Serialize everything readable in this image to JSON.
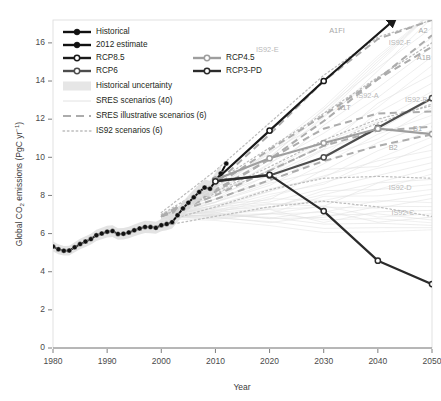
{
  "chart_data": {
    "type": "line",
    "title": "",
    "xlabel": "Year",
    "ylabel": "Global CO2 emissions (PgC yr-1)",
    "ylabel_rich": "Global CO₂ emissions (PgC yr⁻¹)",
    "xlim": [
      1980,
      2050
    ],
    "ylim": [
      0,
      17.2
    ],
    "xticks": [
      1980,
      1990,
      2000,
      2010,
      2020,
      2030,
      2040,
      2050
    ],
    "yticks": [
      0,
      2,
      4,
      6,
      8,
      10,
      12,
      14,
      16
    ],
    "grid": false,
    "legend_position": "top-left",
    "series": [
      {
        "name": "Historical",
        "style": "solid-black-filled-markers",
        "color": "#111111",
        "x": [
          1980,
          1981,
          1982,
          1983,
          1984,
          1985,
          1986,
          1987,
          1988,
          1989,
          1990,
          1991,
          1992,
          1993,
          1994,
          1995,
          1996,
          1997,
          1998,
          1999,
          2000,
          2001,
          2002,
          2003,
          2004,
          2005,
          2006,
          2007,
          2008,
          2009,
          2010,
          2011
        ],
        "values": [
          5.32,
          5.18,
          5.1,
          5.11,
          5.28,
          5.45,
          5.58,
          5.71,
          5.91,
          6.0,
          6.1,
          6.13,
          5.98,
          5.99,
          6.06,
          6.17,
          6.27,
          6.35,
          6.34,
          6.3,
          6.44,
          6.5,
          6.6,
          6.96,
          7.32,
          7.62,
          7.9,
          8.18,
          8.41,
          8.35,
          8.75,
          9.15
        ],
        "uncertainty_band_pct": 5
      },
      {
        "name": "2012 estimate",
        "style": "solid-black-filled-markers",
        "color": "#111111",
        "x": [
          2011,
          2012
        ],
        "values": [
          9.15,
          9.67
        ]
      },
      {
        "name": "RCP8.5",
        "style": "solid-dark-open-markers",
        "color": "#1a1a1a",
        "x": [
          2010,
          2020,
          2030,
          2043
        ],
        "values": [
          8.8,
          11.4,
          14.0,
          17.2
        ],
        "marker_years": [
          2010,
          2020,
          2030
        ],
        "arrow_end": true
      },
      {
        "name": "RCP6",
        "style": "solid-mid-open-markers",
        "color": "#4d4d4d",
        "x": [
          2010,
          2020,
          2030,
          2040,
          2050
        ],
        "values": [
          8.78,
          9.05,
          10.0,
          11.55,
          13.1
        ]
      },
      {
        "name": "RCP4.5",
        "style": "solid-light-open-markers",
        "color": "#9e9e9e",
        "x": [
          2010,
          2020,
          2030,
          2040,
          2050
        ],
        "values": [
          8.82,
          9.95,
          10.75,
          11.5,
          11.22
        ]
      },
      {
        "name": "RCP3-PD",
        "style": "solid-dark-open-markers",
        "color": "#2b2b2b",
        "x": [
          2010,
          2020,
          2030,
          2040,
          2050
        ],
        "values": [
          8.74,
          9.08,
          7.18,
          4.58,
          3.35
        ]
      }
    ],
    "sres_illustrative": [
      {
        "name": "A1FI",
        "x": [
          2000,
          2010,
          2020,
          2030,
          2040,
          2050
        ],
        "values": [
          6.9,
          8.6,
          11.2,
          14.0,
          16.2,
          17.2
        ],
        "label_xy": [
          2031,
          16.6
        ]
      },
      {
        "name": "A2",
        "x": [
          2000,
          2010,
          2020,
          2030,
          2040,
          2050
        ],
        "values": [
          6.9,
          8.3,
          9.9,
          11.9,
          14.1,
          16.4
        ],
        "label_xy": [
          2047.5,
          16.6
        ]
      },
      {
        "name": "A1B",
        "x": [
          2000,
          2010,
          2020,
          2030,
          2040,
          2050
        ],
        "values": [
          6.9,
          8.5,
          10.4,
          12.2,
          14.1,
          15.8
        ],
        "label_xy": [
          2047.2,
          15.2
        ]
      },
      {
        "name": "A1T",
        "x": [
          2000,
          2010,
          2020,
          2030,
          2040,
          2050
        ],
        "values": [
          6.9,
          8.2,
          9.9,
          11.5,
          12.3,
          12.4
        ],
        "label_xy": [
          2032.5,
          12.6
        ]
      },
      {
        "name": "B1",
        "x": [
          2000,
          2010,
          2020,
          2030,
          2040,
          2050
        ],
        "values": [
          6.9,
          8.0,
          9.3,
          10.6,
          11.4,
          11.6
        ],
        "label_xy": [
          2046.5,
          11.5
        ]
      },
      {
        "name": "B2",
        "x": [
          2000,
          2010,
          2020,
          2030,
          2040,
          2050
        ],
        "values": [
          6.9,
          7.8,
          8.8,
          9.8,
          10.6,
          11.2
        ],
        "label_xy": [
          2042.0,
          10.5
        ]
      }
    ],
    "is92_scenarios": [
      {
        "name": "IS92-E",
        "x": [
          2000,
          2010,
          2020,
          2030,
          2040,
          2050
        ],
        "values": [
          7.1,
          9.3,
          11.8,
          14.3,
          16.3,
          17.2
        ],
        "label_xy": [
          2017.5,
          15.6
        ]
      },
      {
        "name": "IS92-F",
        "x": [
          2000,
          2010,
          2020,
          2030,
          2040,
          2050
        ],
        "values": [
          7.0,
          8.7,
          10.5,
          12.3,
          14.2,
          16.0
        ],
        "label_xy": [
          2042.0,
          16.0
        ]
      },
      {
        "name": "IS92-A",
        "x": [
          2000,
          2010,
          2020,
          2030,
          2040,
          2050
        ],
        "values": [
          6.9,
          8.2,
          9.5,
          10.9,
          12.0,
          12.7
        ],
        "label_xy": [
          2036.0,
          13.2
        ]
      },
      {
        "name": "IS92-B",
        "x": [
          2000,
          2010,
          2020,
          2030,
          2040,
          2050
        ],
        "values": [
          6.9,
          8.1,
          9.3,
          10.6,
          11.8,
          12.8
        ],
        "label_xy": [
          2045.0,
          13.0
        ]
      },
      {
        "name": "IS92-D",
        "x": [
          2000,
          2010,
          2020,
          2030,
          2040,
          2050
        ],
        "values": [
          6.6,
          7.4,
          8.3,
          8.9,
          9.0,
          8.9
        ],
        "label_xy": [
          2042.0,
          8.4
        ]
      },
      {
        "name": "IS92-C",
        "x": [
          2000,
          2010,
          2020,
          2030,
          2040,
          2050
        ],
        "values": [
          6.4,
          6.9,
          7.4,
          7.7,
          7.4,
          6.9
        ],
        "label_xy": [
          2042.5,
          7.1
        ]
      }
    ],
    "sres_ensemble_count": 40,
    "sres_illustrative_count": 6,
    "is92_count": 6
  },
  "legend": {
    "items": [
      {
        "label": "Historical",
        "kind": "line-filled-marker",
        "color": "#111111"
      },
      {
        "label": "2012 estimate",
        "kind": "line-filled-marker",
        "color": "#111111"
      },
      {
        "label": "RCP8.5",
        "kind": "line-open-marker",
        "color": "#1a1a1a"
      },
      {
        "label": "RCP4.5",
        "kind": "line-open-marker",
        "color": "#9e9e9e"
      },
      {
        "label": "RCP6",
        "kind": "line-open-marker",
        "color": "#4d4d4d"
      },
      {
        "label": "RCP3-PD",
        "kind": "line-open-marker",
        "color": "#2b2b2b"
      },
      {
        "label": "Historical uncertainty",
        "kind": "band",
        "color": "#e8e8e8"
      },
      {
        "label": "SRES scenarios (40)",
        "kind": "thin-line",
        "color": "#dcdcdc"
      },
      {
        "label": "SRES illustrative scenarios (6)",
        "kind": "dashed-line",
        "color": "#b0b0b0"
      },
      {
        "label": "IS92 scenarios (6)",
        "kind": "dotted-line",
        "color": "#c2c2c2"
      }
    ]
  },
  "colors": {
    "background": "#ffffff",
    "text": "#231f20",
    "axis": "#6f6f6f",
    "annotation": "#b9b9b9",
    "band": "#e8e8e8"
  }
}
